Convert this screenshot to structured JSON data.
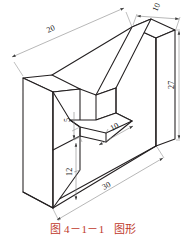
{
  "figure": {
    "title": "图形",
    "caption_number": "图 4－1－1",
    "caption_label": "图形",
    "caption_full": "图 4－1－1   图形",
    "caption_color": "#c0392b",
    "line_color": "#231f20",
    "dimension_line_color": "#8a8a8a",
    "background_color": "#ffffff",
    "projection": "isometric",
    "object_name": "v-block-bracket"
  },
  "dimensions": {
    "top_left_depth": "20",
    "top_right_width": "10",
    "right_height": "27",
    "notch_small_height": "5",
    "notch_width": "10",
    "left_height": "12",
    "bottom_length": "30"
  },
  "dimension_list": [
    {
      "value": "20",
      "name": "dimension-20-top-left"
    },
    {
      "value": "10",
      "name": "dimension-10-top-right"
    },
    {
      "value": "27",
      "name": "dimension-27-right"
    },
    {
      "value": "5",
      "name": "dimension-5-notch"
    },
    {
      "value": "10",
      "name": "dimension-10-notch"
    },
    {
      "value": "12",
      "name": "dimension-12-left"
    },
    {
      "value": "30",
      "name": "dimension-30-bottom"
    }
  ]
}
